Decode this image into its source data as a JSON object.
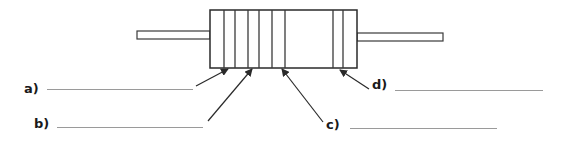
{
  "diagram": {
    "stroke_color": "#3a3a3a",
    "answer_line_color": "#9a9a9a",
    "body": {
      "x": 210,
      "y": 10,
      "w": 147,
      "h": 58
    },
    "lead_left": {
      "x": 137,
      "y": 31,
      "w": 73,
      "h": 8
    },
    "lead_right": {
      "x": 357,
      "y": 33,
      "w": 86,
      "h": 8
    },
    "bands_x": [
      224,
      235,
      248,
      259,
      272,
      285,
      333,
      343
    ],
    "labels": [
      {
        "id": "a",
        "text": "a)",
        "x": 24,
        "y": 82,
        "line": {
          "x1": 47,
          "x2": 193,
          "y": 89
        },
        "arrow": {
          "x1": 196,
          "y1": 86,
          "x2": 228,
          "y2": 69
        }
      },
      {
        "id": "b",
        "text": "b)",
        "x": 34,
        "y": 117,
        "line": {
          "x1": 57,
          "x2": 203,
          "y": 127
        },
        "arrow": {
          "x1": 208,
          "y1": 121,
          "x2": 252,
          "y2": 69
        }
      },
      {
        "id": "c",
        "text": "c)",
        "x": 326,
        "y": 118,
        "line": {
          "x1": 350,
          "x2": 497,
          "y": 128
        },
        "arrow": {
          "x1": 323,
          "y1": 122,
          "x2": 282,
          "y2": 69
        }
      },
      {
        "id": "d",
        "text": "d)",
        "x": 372,
        "y": 78,
        "line": {
          "x1": 395,
          "x2": 543,
          "y": 90
        },
        "arrow": {
          "x1": 369,
          "y1": 89,
          "x2": 340,
          "y2": 70
        }
      }
    ]
  }
}
